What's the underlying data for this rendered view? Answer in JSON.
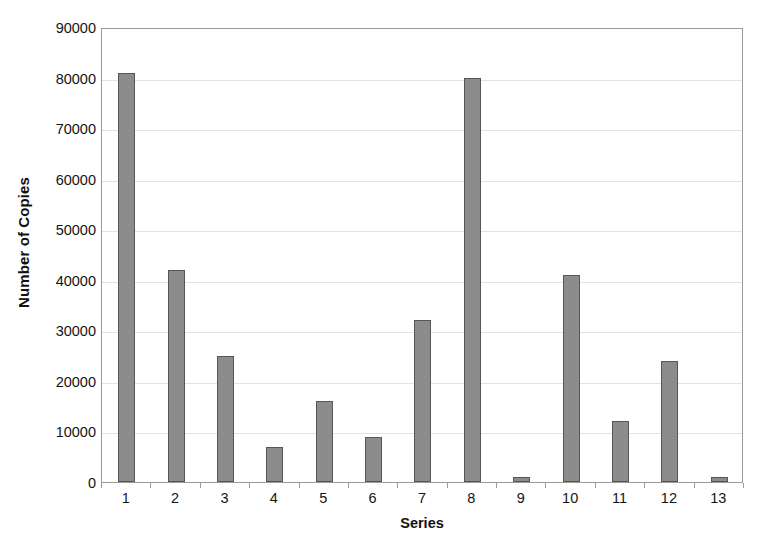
{
  "chart_data": {
    "type": "bar",
    "title": "",
    "xlabel": "Series",
    "ylabel": "Number of Copies",
    "categories": [
      "1",
      "2",
      "3",
      "4",
      "5",
      "6",
      "7",
      "8",
      "9",
      "10",
      "11",
      "12",
      "13"
    ],
    "values": [
      81000,
      42000,
      25000,
      7000,
      16000,
      9000,
      32000,
      80000,
      1000,
      41000,
      12000,
      24000,
      1000
    ],
    "ylim": [
      0,
      90000
    ],
    "ytick_labels": [
      "0",
      "10000",
      "20000",
      "30000",
      "40000",
      "50000",
      "60000",
      "70000",
      "80000",
      "90000"
    ],
    "ytick_values": [
      0,
      10000,
      20000,
      30000,
      40000,
      50000,
      60000,
      70000,
      80000,
      90000
    ],
    "ystep": 10000,
    "grid": true,
    "legend": false,
    "legend_position": "none",
    "bar_fill_color": "#8c8c8c",
    "bar_border_color": "#565656",
    "gridline_color": "#e2e2e2",
    "axis_color": "#9a9a9a",
    "background_color": "#ffffff"
  }
}
